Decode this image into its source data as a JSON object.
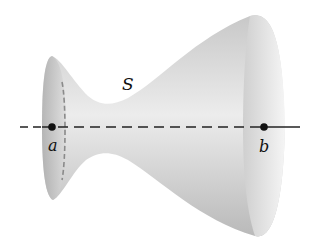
{
  "diagram": {
    "type": "surface-of-revolution",
    "surface_label": "S",
    "axis": {
      "style": "dashed-inside-solid-outside"
    },
    "points": [
      {
        "name": "a",
        "label": "a"
      },
      {
        "name": "b",
        "label": "b"
      }
    ]
  }
}
